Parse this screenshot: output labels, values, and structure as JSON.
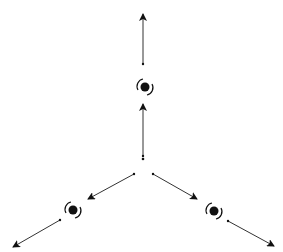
{
  "diagram": {
    "caption_cut_off": "(caption text cut off at top edge)",
    "line_color": "#333333",
    "galaxy_color": "#111111",
    "center_point": {
      "x": 143,
      "y": 159
    },
    "branches": [
      {
        "name": "up",
        "inner_arrow": {
          "from": [
            143,
            156
          ],
          "to": [
            143,
            104
          ]
        },
        "galaxy": {
          "x": 145,
          "y": 87
        },
        "outer_arrow": {
          "from": [
            143,
            64
          ],
          "to": [
            143,
            14
          ]
        }
      },
      {
        "name": "lower-left",
        "inner_arrow": {
          "from": [
            134,
            174
          ],
          "to": [
            88,
            199
          ]
        },
        "galaxy": {
          "x": 73,
          "y": 210
        },
        "outer_arrow": {
          "from": [
            60,
            220
          ],
          "to": [
            13,
            247
          ]
        }
      },
      {
        "name": "lower-right",
        "inner_arrow": {
          "from": [
            153,
            174
          ],
          "to": [
            197,
            199
          ]
        },
        "galaxy": {
          "x": 214,
          "y": 211
        },
        "outer_arrow": {
          "from": [
            228,
            221
          ],
          "to": [
            274,
            246
          ]
        }
      }
    ]
  }
}
